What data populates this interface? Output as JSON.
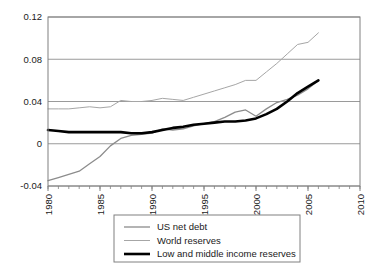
{
  "chart_data": {
    "type": "line",
    "title": "",
    "subtitle": "",
    "xlabel": "",
    "ylabel": "",
    "xlim": [
      1980,
      2010
    ],
    "ylim": [
      -0.04,
      0.12
    ],
    "xticks": [
      1980,
      1985,
      1990,
      1995,
      2000,
      2005,
      2010
    ],
    "xtick_labels": [
      "1980",
      "1985",
      "1990",
      "1995",
      "2000",
      "2005",
      "2010"
    ],
    "yticks": [
      -0.04,
      0,
      0.04,
      0.08,
      0.12
    ],
    "ytick_labels": [
      "-0.04",
      "0",
      "0.04",
      "0.08",
      "0.12"
    ],
    "minor_xticks_every": 1,
    "grid": "horizontal",
    "legend_position": "below-center",
    "x": [
      1980,
      1981,
      1982,
      1983,
      1984,
      1985,
      1986,
      1987,
      1988,
      1989,
      1990,
      1991,
      1992,
      1993,
      1994,
      1995,
      1996,
      1997,
      1998,
      1999,
      2000,
      2001,
      2002,
      2003,
      2004,
      2005,
      2006
    ],
    "series": [
      {
        "name": "US net debt",
        "color": "#8c8c8c",
        "width": 1.3,
        "values": [
          -0.035,
          -0.032,
          -0.029,
          -0.026,
          -0.019,
          -0.012,
          -0.002,
          0.005,
          0.008,
          0.009,
          0.01,
          0.014,
          0.013,
          0.014,
          0.017,
          0.019,
          0.021,
          0.025,
          0.03,
          0.032,
          0.026,
          0.033,
          0.039,
          0.042,
          0.046,
          0.052,
          0.06
        ]
      },
      {
        "name": "World reserves",
        "color": "#a6a6a6",
        "width": 1.0,
        "values": [
          0.033,
          0.033,
          0.033,
          0.034,
          0.035,
          0.034,
          0.035,
          0.041,
          0.04,
          0.04,
          0.041,
          0.043,
          0.042,
          0.041,
          0.044,
          0.047,
          0.05,
          0.053,
          0.056,
          0.06,
          0.06,
          0.068,
          0.076,
          0.085,
          0.094,
          0.096,
          0.105
        ]
      },
      {
        "name": "Low and middle income reserves",
        "color": "#000000",
        "width": 2.6,
        "values": [
          0.013,
          0.012,
          0.011,
          0.011,
          0.011,
          0.011,
          0.011,
          0.011,
          0.01,
          0.01,
          0.011,
          0.013,
          0.015,
          0.016,
          0.018,
          0.019,
          0.02,
          0.021,
          0.021,
          0.022,
          0.024,
          0.028,
          0.033,
          0.04,
          0.048,
          0.054,
          0.06
        ]
      }
    ]
  },
  "legend": {
    "items": [
      {
        "label": "US net debt"
      },
      {
        "label": "World reserves"
      },
      {
        "label": "Low and middle income reserves"
      }
    ]
  },
  "colors": {
    "axis": "#808080",
    "grid": "#9a9a9a",
    "plot_background": "#ffffff",
    "page_background": "#ffffff",
    "legend_border": "#808080",
    "text": "#1a1a1a"
  }
}
